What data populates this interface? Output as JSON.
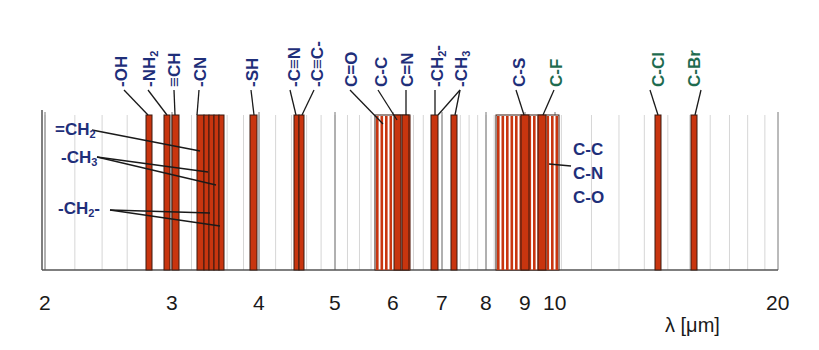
{
  "colors": {
    "bar_fill": "#c8350f",
    "bar_stroke": "#3a1a10",
    "label_blue": "#1f2f7a",
    "label_green": "#1e6b4f",
    "grid": "#d6d6d6",
    "axis": "#555555"
  },
  "axis": {
    "title": "λ [μm]",
    "scale": "log",
    "ticks": [
      {
        "label": "2",
        "value": 2,
        "x": 45
      },
      {
        "label": "3",
        "value": 3,
        "x": 172
      },
      {
        "label": "4",
        "value": 4,
        "x": 259
      },
      {
        "label": "5",
        "value": 5,
        "x": 335
      },
      {
        "label": "6",
        "value": 6,
        "x": 393
      },
      {
        "label": "7",
        "value": 7,
        "x": 442
      },
      {
        "label": "8",
        "value": 8,
        "x": 486
      },
      {
        "label": "9",
        "value": 9,
        "x": 525
      },
      {
        "label": "10",
        "value": 10,
        "x": 555
      },
      {
        "label": "20",
        "value": 20,
        "x": 778
      }
    ]
  },
  "top_labels": [
    {
      "text": "-OH",
      "color": "blue",
      "x": 112,
      "line": [
        124,
        90,
        148,
        115
      ]
    },
    {
      "text": "-NH₂",
      "color": "blue",
      "x": 140,
      "line": [
        148,
        90,
        167,
        115
      ]
    },
    {
      "text": "≡CH",
      "color": "blue",
      "x": 165,
      "line": [
        174,
        90,
        175,
        115
      ]
    },
    {
      "text": "-CN",
      "color": "blue",
      "x": 191,
      "line": [
        199,
        90,
        197,
        115
      ]
    },
    {
      "text": "-SH",
      "color": "blue",
      "x": 243,
      "line": [
        251,
        90,
        254,
        115
      ]
    },
    {
      "text": "-C≡N",
      "color": "blue",
      "x": 285,
      "line": [
        290,
        90,
        296,
        115
      ]
    },
    {
      "text": "-C≡C-",
      "color": "blue",
      "x": 308,
      "line": [
        314,
        90,
        302,
        115
      ]
    },
    {
      "text": "C=O",
      "color": "blue",
      "x": 342,
      "line": [
        350,
        90,
        383,
        124
      ]
    },
    {
      "text": "C-C",
      "color": "blue",
      "x": 372,
      "line": [
        378,
        90,
        397,
        120
      ]
    },
    {
      "text": "C=N",
      "color": "blue",
      "x": 398,
      "line": [
        406,
        90,
        406,
        115
      ]
    },
    {
      "text": "-CH₂-",
      "color": "blue",
      "x": 428,
      "line": [
        435,
        90,
        435,
        115
      ]
    },
    {
      "text": "-CH₃",
      "color": "blue",
      "x": 452,
      "line": [
        460,
        90,
        438,
        115,
        460,
        90,
        455,
        115
      ]
    },
    {
      "text": "C-S",
      "color": "blue",
      "x": 510,
      "line": [
        516,
        90,
        524,
        115
      ]
    },
    {
      "text": "C-F",
      "color": "green",
      "x": 547,
      "line": [
        554,
        90,
        543,
        115
      ]
    },
    {
      "text": "C-Cl",
      "color": "green",
      "x": 649,
      "line": [
        650,
        90,
        658,
        115
      ]
    },
    {
      "text": "C-Br",
      "color": "green",
      "x": 685,
      "line": [
        701,
        90,
        695,
        115
      ]
    }
  ],
  "side_labels": [
    {
      "text": "=CH₂",
      "x": 55,
      "y": 120
    },
    {
      "text": "-CH₃",
      "x": 61,
      "y": 148
    },
    {
      "text": "-CH₂-",
      "x": 58,
      "y": 199
    },
    {
      "text": "C-C",
      "x": 573,
      "y": 140
    },
    {
      "text": "C-N",
      "x": 573,
      "y": 164
    },
    {
      "text": "C-O",
      "x": 573,
      "y": 188
    }
  ],
  "bars": [
    {
      "label": "-OH",
      "x": 146,
      "w": 6
    },
    {
      "label": "-NH₂",
      "x": 164,
      "w": 6
    },
    {
      "label": "≡CH",
      "x": 172,
      "w": 7
    },
    {
      "label": "-CN / CH",
      "x": 197,
      "w": 7
    },
    {
      "label": "CH",
      "x": 204,
      "w": 5
    },
    {
      "label": "CH",
      "x": 209,
      "w": 5
    },
    {
      "label": "CH",
      "x": 214,
      "w": 5
    },
    {
      "label": "CH",
      "x": 219,
      "w": 5
    },
    {
      "label": "-SH",
      "x": 250,
      "w": 7
    },
    {
      "label": "-C≡N",
      "x": 294,
      "w": 5
    },
    {
      "label": "-C≡C-",
      "x": 299,
      "w": 5
    },
    {
      "label": "C-C",
      "x": 394,
      "w": 7
    },
    {
      "label": "C=N",
      "x": 402,
      "w": 7
    },
    {
      "label": "-CH₂-",
      "x": 431,
      "w": 7
    },
    {
      "label": "-CH₃",
      "x": 451,
      "w": 6
    },
    {
      "label": "C-S",
      "x": 521,
      "w": 8
    },
    {
      "label": "C-F",
      "x": 538,
      "w": 8
    },
    {
      "label": "C-Cl",
      "x": 655,
      "w": 6
    },
    {
      "label": "C-Br",
      "x": 691,
      "w": 6
    }
  ],
  "striped_ranges": [
    {
      "label": "C=O region",
      "x": 375,
      "w": 35
    },
    {
      "label": "C-C / C-N / C-O region",
      "x": 496,
      "w": 63
    }
  ],
  "side_leaders": [
    [
      92,
      130,
      200,
      151
    ],
    [
      97,
      157,
      208,
      172
    ],
    [
      97,
      157,
      216,
      185
    ],
    [
      110,
      210,
      210,
      213
    ],
    [
      110,
      210,
      220,
      226
    ],
    [
      571,
      166,
      549,
      164
    ]
  ]
}
